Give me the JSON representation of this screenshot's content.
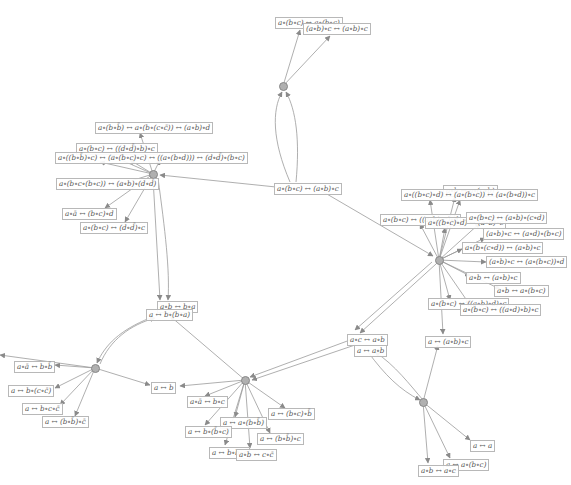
{
  "colors": {
    "edge": "#9a9a9a",
    "node_fill": "#b0b0b0",
    "node_stroke": "#888888",
    "label_border": "#b8b8b8",
    "label_text": "#555555"
  },
  "nodes": [
    {
      "id": "n_top",
      "x": 283,
      "y": 86
    },
    {
      "id": "n_left",
      "x": 153,
      "y": 174
    },
    {
      "id": "n_right",
      "x": 439,
      "y": 260
    },
    {
      "id": "n_ll",
      "x": 95,
      "y": 368
    },
    {
      "id": "n_mid",
      "x": 245,
      "y": 380
    },
    {
      "id": "n_br",
      "x": 423,
      "y": 402
    }
  ],
  "labels": [
    {
      "id": "l_top1",
      "text": "a∘(b∘c) ↔ a∘(b∘c)",
      "x": 275,
      "y": 17
    },
    {
      "id": "l_top2",
      "text": "(a∘b)∘c ↔ (a∘b)∘c",
      "x": 303,
      "y": 23
    },
    {
      "id": "l_center",
      "text": "a∘(b∘c) ↔ (a∘b)∘c",
      "x": 274,
      "y": 183
    },
    {
      "id": "l_left1",
      "text": "a∘(b∘b̄) ↔ a∘(b∘(c∘c̄)) ↔ (a∘b)∘d",
      "x": 95,
      "y": 122
    },
    {
      "id": "l_left2",
      "text": "a∘(b∘c) ↔ ((d∘d̄)∘b)∘c",
      "x": 76,
      "y": 143
    },
    {
      "id": "l_left3",
      "text": "a∘((b∘b̄)∘c) ↔ (a∘(b∘c)∘c) ↔ ((a∘(b∘d))) ↔ (d∘d̄)∘(b∘c)",
      "x": 55,
      "y": 152
    },
    {
      "id": "l_left4",
      "text": "a∘(b∘c∘(b∘c)) ↔ (a∘b)∘(d∘d̄)",
      "x": 56,
      "y": 178
    },
    {
      "id": "l_left5",
      "text": "a∘ā ↔ (b∘c)∘d",
      "x": 62,
      "y": 208
    },
    {
      "id": "l_left6",
      "text": "a∘(b∘c) ↔ (d∘d̄)∘c",
      "x": 80,
      "y": 222
    },
    {
      "id": "l_r1",
      "text": "a∘b ↔ a∘(c∘b)",
      "x": 443,
      "y": 185
    },
    {
      "id": "l_r2",
      "text": "a∘((b∘c)∘d) ↔ (a∘(b∘c)) ↔ (a∘(b∘d))∘c",
      "x": 401,
      "y": 189
    },
    {
      "id": "l_r3",
      "text": "a∘(b∘c) ↔ ((a∘b)∘c)∘d",
      "x": 380,
      "y": 214
    },
    {
      "id": "l_r4",
      "text": "a∘((b∘c)∘d) ↔ (a∘b)∘c",
      "x": 425,
      "y": 217
    },
    {
      "id": "l_r5",
      "text": "a∘(b∘c) ↔ (a∘b)∘(c∘d)",
      "x": 466,
      "y": 212
    },
    {
      "id": "l_r6",
      "text": "(a∘b)∘c ↔ (a∘d)∘(b∘c)",
      "x": 483,
      "y": 228
    },
    {
      "id": "l_r7",
      "text": "a∘(b∘(c∘d)) ↔ (a∘b)∘c",
      "x": 462,
      "y": 242
    },
    {
      "id": "l_r8",
      "text": "(a∘b)∘c ↔ (a∘(b∘c))∘d",
      "x": 486,
      "y": 256
    },
    {
      "id": "l_r9",
      "text": "a∘b ↔ (a∘b)∘c",
      "x": 466,
      "y": 272
    },
    {
      "id": "l_r10",
      "text": "a∘b ↔ a∘(b∘c)",
      "x": 494,
      "y": 285
    },
    {
      "id": "l_r11",
      "text": "a∘(b∘c) ↔ ((a∘b)∘d)∘c",
      "x": 428,
      "y": 298
    },
    {
      "id": "l_r12",
      "text": "a∘(b∘c) ↔ ((a∘d)∘b)∘c",
      "x": 460,
      "y": 304
    },
    {
      "id": "l_r13",
      "text": "a ↔ (a∘b)∘c",
      "x": 425,
      "y": 336
    },
    {
      "id": "l_stack1",
      "text": "a∘b ↔ b∘a",
      "x": 157,
      "y": 301
    },
    {
      "id": "l_stack2",
      "text": "a ↔ b∘(b∘a)",
      "x": 146,
      "y": 309
    },
    {
      "id": "l_ll1",
      "text": "a∘ā ↔ b∘b̄",
      "x": 14,
      "y": 361
    },
    {
      "id": "l_ll2",
      "text": "a ↔ b∘(c∘c̄)",
      "x": 8,
      "y": 385
    },
    {
      "id": "l_ll3",
      "text": "a ↔ b∘c∘c̄",
      "x": 22,
      "y": 403
    },
    {
      "id": "l_ll4",
      "text": "a ↔ (b∘b̄)∘c̄",
      "x": 42,
      "y": 416
    },
    {
      "id": "l_aleftb",
      "text": "a ↔ b",
      "x": 151,
      "y": 382
    },
    {
      "id": "l_m1",
      "text": "a∘ā ↔ b∘c",
      "x": 187,
      "y": 396
    },
    {
      "id": "l_m2",
      "text": "a ↔ (b∘c)∘b̄",
      "x": 268,
      "y": 408
    },
    {
      "id": "l_m3",
      "text": "a ↔ a∘(b∘b̄)",
      "x": 220,
      "y": 417
    },
    {
      "id": "l_m4",
      "text": "a ↔ b∘(b̄∘c)",
      "x": 185,
      "y": 426
    },
    {
      "id": "l_m5",
      "text": "a ↔ (b∘b̄)∘c",
      "x": 257,
      "y": 433
    },
    {
      "id": "l_m6",
      "text": "a ↔ b∘b∘c",
      "x": 209,
      "y": 447
    },
    {
      "id": "l_m7",
      "text": "a∘b ↔ c∘c̄",
      "x": 236,
      "y": 449
    },
    {
      "id": "l_br1",
      "text": "a∘c ↔ a∘b",
      "x": 347,
      "y": 334
    },
    {
      "id": "l_br2",
      "text": "a ↔ a∘b",
      "x": 354,
      "y": 345
    },
    {
      "id": "l_br3",
      "text": "a ↔ a",
      "x": 470,
      "y": 440
    },
    {
      "id": "l_br4",
      "text": "a ↔ a∘(b∘c)",
      "x": 443,
      "y": 459
    },
    {
      "id": "l_br5",
      "text": "a∘b ↔ a∘c",
      "x": 418,
      "y": 465
    }
  ]
}
